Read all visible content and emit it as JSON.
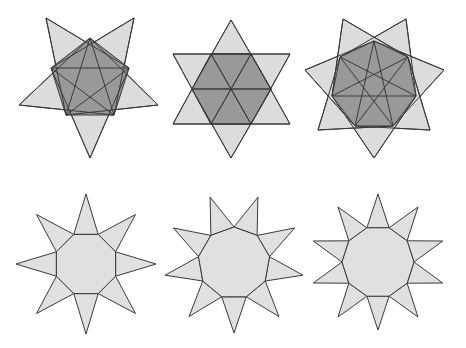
{
  "colors": {
    "background": "#ffffff",
    "stroke": "#3a3a3a",
    "dark_fill": "#999999",
    "light_fill": "#e0e0e0",
    "triangle_fill": "#dcdcdc"
  },
  "stars": [
    {
      "name": "pentagram-star",
      "sides": 5,
      "style": "overlapping",
      "center": [
        90,
        88
      ],
      "polygon_points": [
        [
          90,
          38
        ],
        [
          129,
          68
        ],
        [
          114,
          115
        ],
        [
          66,
          115
        ],
        [
          51,
          68
        ]
      ],
      "tips": [
        [
          134,
          18
        ],
        [
          158,
          105
        ],
        [
          90,
          158
        ],
        [
          19,
          105
        ],
        [
          46,
          18
        ]
      ]
    },
    {
      "name": "hexagram-star",
      "sides": 6,
      "style": "overlapping",
      "center": [
        231,
        89
      ],
      "polygon_points": [
        [
          211,
          54
        ],
        [
          251,
          54
        ],
        [
          271,
          89
        ],
        [
          251,
          124
        ],
        [
          211,
          124
        ],
        [
          192,
          89
        ]
      ],
      "tips": [
        [
          231,
          20
        ],
        [
          290,
          54
        ],
        [
          290,
          124
        ],
        [
          231,
          158
        ],
        [
          173,
          124
        ],
        [
          173,
          54
        ]
      ]
    },
    {
      "name": "heptagram-star",
      "sides": 7,
      "style": "overlapping",
      "center": [
        374,
        92
      ],
      "polygon_points": [
        [
          374,
          41
        ],
        [
          408,
          57
        ],
        [
          416,
          96
        ],
        [
          393,
          126
        ],
        [
          355,
          126
        ],
        [
          332,
          96
        ],
        [
          340,
          57
        ]
      ],
      "tips": [
        [
          406,
          19
        ],
        [
          444,
          70
        ],
        [
          430,
          130
        ],
        [
          374,
          158
        ],
        [
          318,
          130
        ],
        [
          305,
          70
        ],
        [
          343,
          19
        ]
      ]
    },
    {
      "name": "octagon-star",
      "sides": 8,
      "style": "attached",
      "center": [
        86,
        264
      ],
      "inner_radius": 32,
      "outer_radius": 70,
      "rotation_deg": 22.5
    },
    {
      "name": "nonagon-star",
      "sides": 9,
      "style": "attached",
      "center": [
        234,
        263
      ],
      "inner_radius": 36,
      "outer_radius": 70,
      "rotation_deg": -90
    },
    {
      "name": "decagon-star",
      "sides": 10,
      "style": "attached",
      "center": [
        378,
        262
      ],
      "inner_radius": 36,
      "outer_radius": 68,
      "rotation_deg": -72
    }
  ]
}
